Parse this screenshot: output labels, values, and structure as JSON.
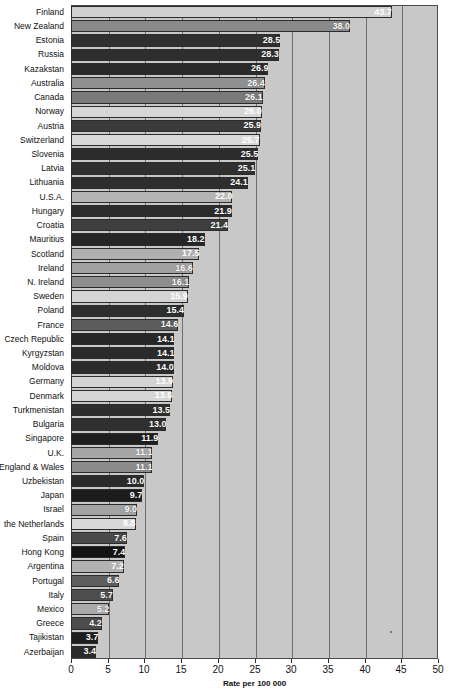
{
  "chart_data": {
    "type": "bar",
    "orientation": "horizontal",
    "title": "",
    "subtitle": "",
    "xlabel": "Rate per 100 000",
    "ylabel": "",
    "xlim": [
      0,
      50
    ],
    "xticks": [
      0,
      5,
      10,
      15,
      20,
      25,
      30,
      35,
      40,
      45,
      50
    ],
    "xtick_labels": [
      "0",
      "5",
      "10",
      "15",
      "20",
      "25",
      "30",
      "35",
      "40",
      "45",
      "50"
    ],
    "grid": "vertical",
    "legend": "none",
    "categories": [
      "Finland",
      "New Zealand",
      "Estonia",
      "Russia",
      "Kazakstan",
      "Australia",
      "Canada",
      "Norway",
      "Austria",
      "Switzerland",
      "Slovenia",
      "Latvia",
      "Lithuania",
      "U.S.A.",
      "Hungary",
      "Croatia",
      "Mauritius",
      "Scotland",
      "Ireland",
      "N. Ireland",
      "Sweden",
      "Poland",
      "France",
      "Czech Republic",
      "Kyrgyzstan",
      "Moldova",
      "Germany",
      "Denmark",
      "Turkmenistan",
      "Bulgaria",
      "Singapore",
      "U.K.",
      "England & Wales",
      "Uzbekistan",
      "Japan",
      "Israel",
      "the Netherlands",
      "Spain",
      "Hong Kong",
      "Argentina",
      "Portugal",
      "Italy",
      "Mexico",
      "Greece",
      "Tajikistan",
      "Azerbaijan"
    ],
    "values": [
      43.7,
      38.0,
      28.5,
      28.3,
      26.9,
      26.4,
      26.1,
      26.0,
      25.9,
      25.7,
      25.5,
      25.1,
      24.1,
      22.0,
      21.9,
      21.4,
      18.2,
      17.5,
      16.6,
      16.1,
      15.9,
      15.4,
      14.6,
      14.1,
      14.1,
      14.0,
      13.9,
      13.8,
      13.5,
      13.0,
      11.9,
      11.1,
      11.1,
      10.0,
      9.7,
      9.0,
      8.8,
      7.6,
      7.4,
      7.2,
      6.6,
      5.7,
      5.2,
      4.2,
      3.7,
      3.4
    ],
    "value_labels": [
      "43.7",
      "38.0",
      "28.5",
      "28.3",
      "26.9",
      "26.4",
      "26.1",
      "26.0",
      "25.9",
      "25.7",
      "25.5",
      "25.1",
      "24.1",
      "22.0",
      "21.9",
      "21.4",
      "18.2",
      "17.5",
      "16.6",
      "16.1",
      "15.9",
      "15.4",
      "14.6",
      "14.1",
      "14.1",
      "14.0",
      "13.9",
      "13.8",
      "13.5",
      "13.0",
      "11.9",
      "11.1",
      "11.1",
      "10.0",
      "9.7",
      "9.0",
      "8.8",
      "7.6",
      "7.4",
      "7.2",
      "6.6",
      "5.7",
      "5.2",
      "4.2",
      "3.7",
      "3.4"
    ],
    "bar_colors": [
      "#d0d0d0",
      "#8a8a8a",
      "#303030",
      "#2e2e2e",
      "#2a2a2a",
      "#909090",
      "#7a7a7a",
      "#d6d6d6",
      "#3a3a3a",
      "#d8d8d8",
      "#2c2c2c",
      "#303030",
      "#2e2e2e",
      "#b4b4b4",
      "#2c2c2c",
      "#3e3e3e",
      "#262626",
      "#b0b0b0",
      "#a0a0a0",
      "#8e8e8e",
      "#d4d4d4",
      "#2e2e2e",
      "#5c5c5c",
      "#262626",
      "#2a2a2a",
      "#2c2c2c",
      "#d2d2d2",
      "#d6d6d6",
      "#2e2e2e",
      "#303030",
      "#1e1e1e",
      "#a6a6a6",
      "#8c8c8c",
      "#2a2a2a",
      "#1c1c1c",
      "#a2a2a2",
      "#d8d8d8",
      "#4a4a4a",
      "#141414",
      "#b2b2b2",
      "#5e5e5e",
      "#4e4e4e",
      "#aaaaaa",
      "#4c4c4c",
      "#1e1e1e",
      "#2a2a2a"
    ]
  },
  "colors": {
    "plot_background": "#c8c8c8",
    "gridline": "#6e6e6e",
    "axis": "#2b2b2b",
    "page_background": "#ffffff",
    "label_text": "#101010",
    "value_text": "#ffffff"
  }
}
